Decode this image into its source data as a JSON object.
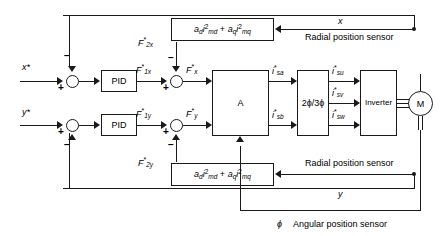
{
  "diagram": {
    "inputs": {
      "x_ref": "x*",
      "y_ref": "y*"
    },
    "controllers": {
      "pid_x": "PID",
      "pid_y": "PID"
    },
    "signals": {
      "f1x": "F*1x",
      "f1y": "F*1y",
      "f2x": "F*2x",
      "f2y": "F*2y",
      "fx": "F*x",
      "fy": "F*y",
      "isa": "i*sa",
      "isb": "i*sb",
      "isu": "i*su",
      "isv": "i*sv",
      "isw": "i*sw"
    },
    "blocks": {
      "matrix": "A",
      "transform": "2ϕ/3ϕ",
      "inverter": "Inverter",
      "motor": "M"
    },
    "formulas": {
      "top": "ad·i²md + aq·i²mq",
      "bottom": "ad·i²md + aq·i²mq"
    },
    "feedback": {
      "x_label": "x",
      "y_label": "y",
      "radial_top": "Radial position sensor",
      "radial_bottom": "Radial position sensor",
      "angular": "Angular position sensor",
      "phi": "ϕ"
    },
    "signs": {
      "x_minus": "−",
      "x_plus": "+",
      "y_minus": "−",
      "y_plus": "+",
      "f2x_minus": "−",
      "f1x_plus": "+",
      "f2y_minus": "−",
      "f1y_plus": "+"
    },
    "colors": {
      "line": "#1a1a1a",
      "background": "#ffffff"
    }
  }
}
